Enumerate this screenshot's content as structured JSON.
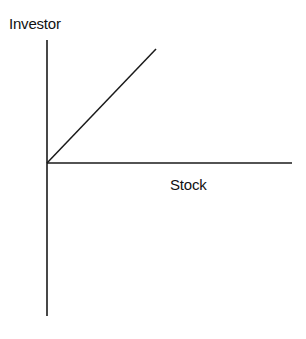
{
  "diagram": {
    "y_axis_label": "Investor",
    "x_axis_label": "Stock",
    "line_color": "#1a1a1a",
    "elements": {
      "vertical_axis": {
        "x1": 47,
        "y1": 40,
        "x2": 47,
        "y2": 316
      },
      "horizontal_axis": {
        "x1": 47,
        "y1": 163,
        "x2": 292,
        "y2": 163
      },
      "diagonal_line": {
        "x1": 47,
        "y1": 163,
        "x2": 156,
        "y2": 49
      }
    }
  }
}
